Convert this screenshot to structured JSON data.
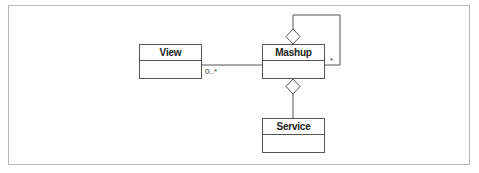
{
  "diagram": {
    "type": "UML class diagram",
    "classes": [
      {
        "id": "view",
        "name": "View"
      },
      {
        "id": "mashup",
        "name": "Mashup"
      },
      {
        "id": "service",
        "name": "Service"
      }
    ],
    "relations": [
      {
        "from": "mashup",
        "to": "view",
        "kind": "association",
        "multiplicity_label": "0..*"
      },
      {
        "from": "mashup",
        "to": "mashup",
        "kind": "aggregation (self)",
        "multiplicity_label": "*"
      },
      {
        "from": "mashup",
        "to": "service",
        "kind": "aggregation",
        "multiplicity_label": ""
      }
    ]
  },
  "labels": {
    "view_mult": "0..*",
    "self_mult": "*"
  },
  "colors": {
    "line": "#555555",
    "frame": "#b8b8b8"
  }
}
